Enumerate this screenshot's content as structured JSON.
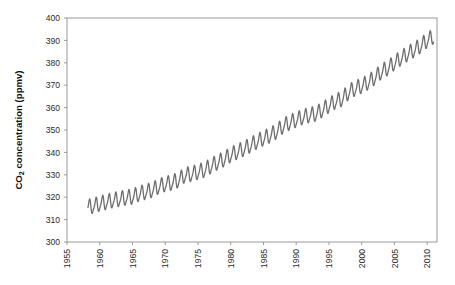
{
  "chart_data": {
    "type": "line",
    "title": "",
    "subtitle": "",
    "xlabel": "",
    "ylabel": "CO2 concentration (ppmv)",
    "ylabel_parts": {
      "pre": "CO",
      "sub": "2",
      "post": " concentration (ppmv)"
    },
    "xlim": [
      1955,
      2011.5
    ],
    "ylim": [
      300,
      400
    ],
    "xticks": [
      1955,
      1960,
      1965,
      1970,
      1975,
      1980,
      1985,
      1990,
      1995,
      2000,
      2005,
      2010
    ],
    "xtick_labels": [
      "1955",
      "1960",
      "1965",
      "1970",
      "1975",
      "1980",
      "1985",
      "1990",
      "1995",
      "2000",
      "2005",
      "2010"
    ],
    "xtick_rotation": -90,
    "yticks": [
      300,
      310,
      320,
      330,
      340,
      350,
      360,
      370,
      380,
      390,
      400
    ],
    "ytick_labels": [
      "300",
      "310",
      "320",
      "330",
      "340",
      "350",
      "360",
      "370",
      "380",
      "390",
      "400"
    ],
    "grid": false,
    "legend": false,
    "legend_position": "none",
    "line_color": "#6E6E6E",
    "line_width": 1.3,
    "axis_color": "#9A9A9A",
    "text_color": "#2B2B2B",
    "background": "#FFFFFF",
    "series": [
      {
        "name": "Monthly mean CO2 (Mauna Loa)",
        "color": "#6E6E6E",
        "x_start": 1958.2,
        "x_end": 2011.0,
        "sampling": "monthly",
        "seasonal_amplitude_ppm": 6.2,
        "seasonal_peak_month": 5,
        "annual_means": [
          {
            "year": 1958,
            "value": 315.3
          },
          {
            "year": 1959,
            "value": 315.98
          },
          {
            "year": 1960,
            "value": 316.91
          },
          {
            "year": 1961,
            "value": 317.64
          },
          {
            "year": 1962,
            "value": 318.45
          },
          {
            "year": 1963,
            "value": 318.99
          },
          {
            "year": 1964,
            "value": 319.62
          },
          {
            "year": 1965,
            "value": 320.04
          },
          {
            "year": 1966,
            "value": 321.38
          },
          {
            "year": 1967,
            "value": 322.16
          },
          {
            "year": 1968,
            "value": 323.04
          },
          {
            "year": 1969,
            "value": 324.62
          },
          {
            "year": 1970,
            "value": 325.68
          },
          {
            "year": 1971,
            "value": 326.32
          },
          {
            "year": 1972,
            "value": 327.45
          },
          {
            "year": 1973,
            "value": 329.68
          },
          {
            "year": 1974,
            "value": 330.18
          },
          {
            "year": 1975,
            "value": 331.11
          },
          {
            "year": 1976,
            "value": 332.04
          },
          {
            "year": 1977,
            "value": 333.83
          },
          {
            "year": 1978,
            "value": 335.4
          },
          {
            "year": 1979,
            "value": 336.84
          },
          {
            "year": 1980,
            "value": 338.75
          },
          {
            "year": 1981,
            "value": 340.11
          },
          {
            "year": 1982,
            "value": 341.45
          },
          {
            "year": 1983,
            "value": 343.05
          },
          {
            "year": 1984,
            "value": 344.65
          },
          {
            "year": 1985,
            "value": 346.12
          },
          {
            "year": 1986,
            "value": 347.42
          },
          {
            "year": 1987,
            "value": 349.19
          },
          {
            "year": 1988,
            "value": 351.57
          },
          {
            "year": 1989,
            "value": 353.12
          },
          {
            "year": 1990,
            "value": 354.39
          },
          {
            "year": 1991,
            "value": 355.61
          },
          {
            "year": 1992,
            "value": 356.45
          },
          {
            "year": 1993,
            "value": 357.1
          },
          {
            "year": 1994,
            "value": 358.83
          },
          {
            "year": 1995,
            "value": 360.82
          },
          {
            "year": 1996,
            "value": 362.61
          },
          {
            "year": 1997,
            "value": 363.73
          },
          {
            "year": 1998,
            "value": 366.7
          },
          {
            "year": 1999,
            "value": 368.38
          },
          {
            "year": 2000,
            "value": 369.55
          },
          {
            "year": 2001,
            "value": 371.14
          },
          {
            "year": 2002,
            "value": 373.28
          },
          {
            "year": 2003,
            "value": 375.8
          },
          {
            "year": 2004,
            "value": 377.52
          },
          {
            "year": 2005,
            "value": 379.8
          },
          {
            "year": 2006,
            "value": 381.9
          },
          {
            "year": 2007,
            "value": 383.79
          },
          {
            "year": 2008,
            "value": 385.6
          },
          {
            "year": 2009,
            "value": 387.43
          },
          {
            "year": 2010,
            "value": 389.9
          },
          {
            "year": 2011,
            "value": 391.65
          }
        ]
      }
    ]
  },
  "figure": {
    "plot_left": 67,
    "plot_right": 437,
    "plot_top": 18,
    "plot_bottom": 242
  }
}
